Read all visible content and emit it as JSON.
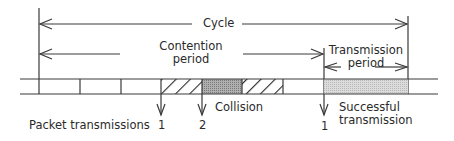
{
  "diagram": {
    "title": "Cycle",
    "labels": {
      "cycle": "Cycle",
      "contention_line1": "Contention",
      "contention_line2": "period",
      "transmission_line1": "Transmission",
      "transmission_line2": "period",
      "collision": "Collision",
      "successful_line1": "Successful",
      "successful_line2": "transmission",
      "packet_transmissions": "Packet transmissions"
    },
    "packet_markers": [
      {
        "label": "1",
        "x": 161
      },
      {
        "label": "2",
        "x": 202
      },
      {
        "label": "1",
        "x": 324
      }
    ],
    "slots": [
      {
        "type": "empty"
      },
      {
        "type": "empty"
      },
      {
        "type": "empty"
      },
      {
        "type": "hatched"
      },
      {
        "type": "collision"
      },
      {
        "type": "hatched"
      },
      {
        "type": "empty"
      },
      {
        "type": "successful"
      }
    ],
    "colors": {
      "line": "#3a3a3a",
      "collision_fill": "#9a9a9a",
      "success_fill": "#cfcfcf"
    }
  }
}
